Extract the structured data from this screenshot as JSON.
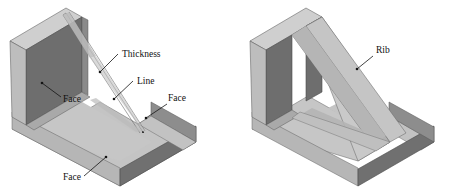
{
  "figure": {
    "background_color": "#ffffff",
    "panels": [
      {
        "id": "left",
        "name": "zero-thickness-rib-part",
        "annotations": [
          {
            "id": "thickness",
            "label": "Thickness",
            "x": 122,
            "y": 57,
            "leader": {
              "from_x": 118,
              "from_y": 54,
              "to_x": 100,
              "to_y": 72,
              "dot_x": 100,
              "dot_y": 72
            }
          },
          {
            "id": "line",
            "label": "Line",
            "x": 137,
            "y": 84,
            "leader": {
              "from_x": 133,
              "from_y": 81,
              "to_x": 114,
              "to_y": 99,
              "dot_x": 114,
              "dot_y": 99
            }
          },
          {
            "id": "face-left",
            "label": "Face",
            "x": 63,
            "y": 102,
            "leader": {
              "from_x": 61,
              "from_y": 97,
              "to_x": 42,
              "to_y": 83,
              "dot_x": 42,
              "dot_y": 83
            }
          },
          {
            "id": "face-right",
            "label": "Face",
            "x": 168,
            "y": 101,
            "leader": {
              "from_x": 167,
              "from_y": 104,
              "to_x": 146,
              "to_y": 118,
              "dot_x": 146,
              "dot_y": 118
            }
          },
          {
            "id": "face-bottom",
            "label": "Face",
            "x": 63,
            "y": 180,
            "leader": {
              "from_x": 84,
              "from_y": 176,
              "to_x": 106,
              "to_y": 157,
              "dot_x": 106,
              "dot_y": 157
            }
          }
        ]
      },
      {
        "id": "right",
        "name": "solid-rib-part",
        "annotations": [
          {
            "id": "rib",
            "label": "Rib",
            "x": 376,
            "y": 53,
            "leader": {
              "from_x": 373,
              "from_y": 56,
              "to_x": 357,
              "to_y": 69,
              "dot_x": 357,
              "dot_y": 69
            }
          }
        ]
      }
    ]
  },
  "colors": {
    "wall_inner_dark": "#6e6e6e",
    "wall_inner_dark2": "#727272",
    "wall_top_light": "#cfcfcf",
    "wall_edge_light": "#bdbdbd",
    "base_top": "#c4c4c4",
    "base_front_dark": "#707070",
    "base_side_mid": "#a8a8a8",
    "rib_side_light": "#c9c9c9",
    "rib_slope_mid": "#b0b0b0",
    "rib_shadow": "#b8b8b8",
    "outline": "#5b5b5b",
    "text": "#101010"
  }
}
